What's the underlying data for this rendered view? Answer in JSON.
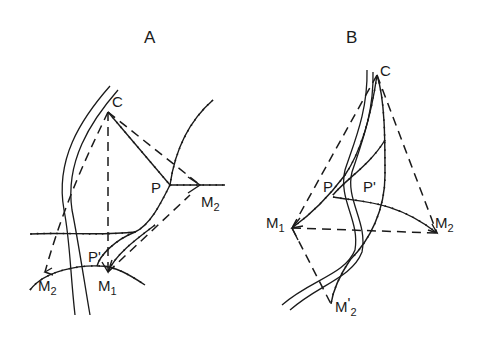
{
  "panels": [
    {
      "id": "A",
      "title": "A",
      "points": {
        "C": {
          "label": "C"
        },
        "P": {
          "label": "P"
        },
        "P_prime": {
          "label": "P",
          "prime": "'"
        },
        "M1": {
          "label": "M",
          "sub": "1"
        },
        "M2": {
          "label": "M",
          "sub": "2"
        },
        "M2_prime": {
          "label": "M",
          "sub": "2",
          "prime": "'"
        }
      }
    },
    {
      "id": "B",
      "title": "B",
      "points": {
        "C": {
          "label": "C"
        },
        "P": {
          "label": "P"
        },
        "P_prime": {
          "label": "P",
          "prime": "'"
        },
        "M1": {
          "label": "M",
          "sub": "1"
        },
        "M2": {
          "label": "M",
          "sub": "2"
        },
        "M2_prime": {
          "label": "M",
          "sub": "2",
          "prime": "'"
        }
      }
    }
  ],
  "colors": {
    "ink": "#1a1a1a",
    "background": "#ffffff"
  }
}
